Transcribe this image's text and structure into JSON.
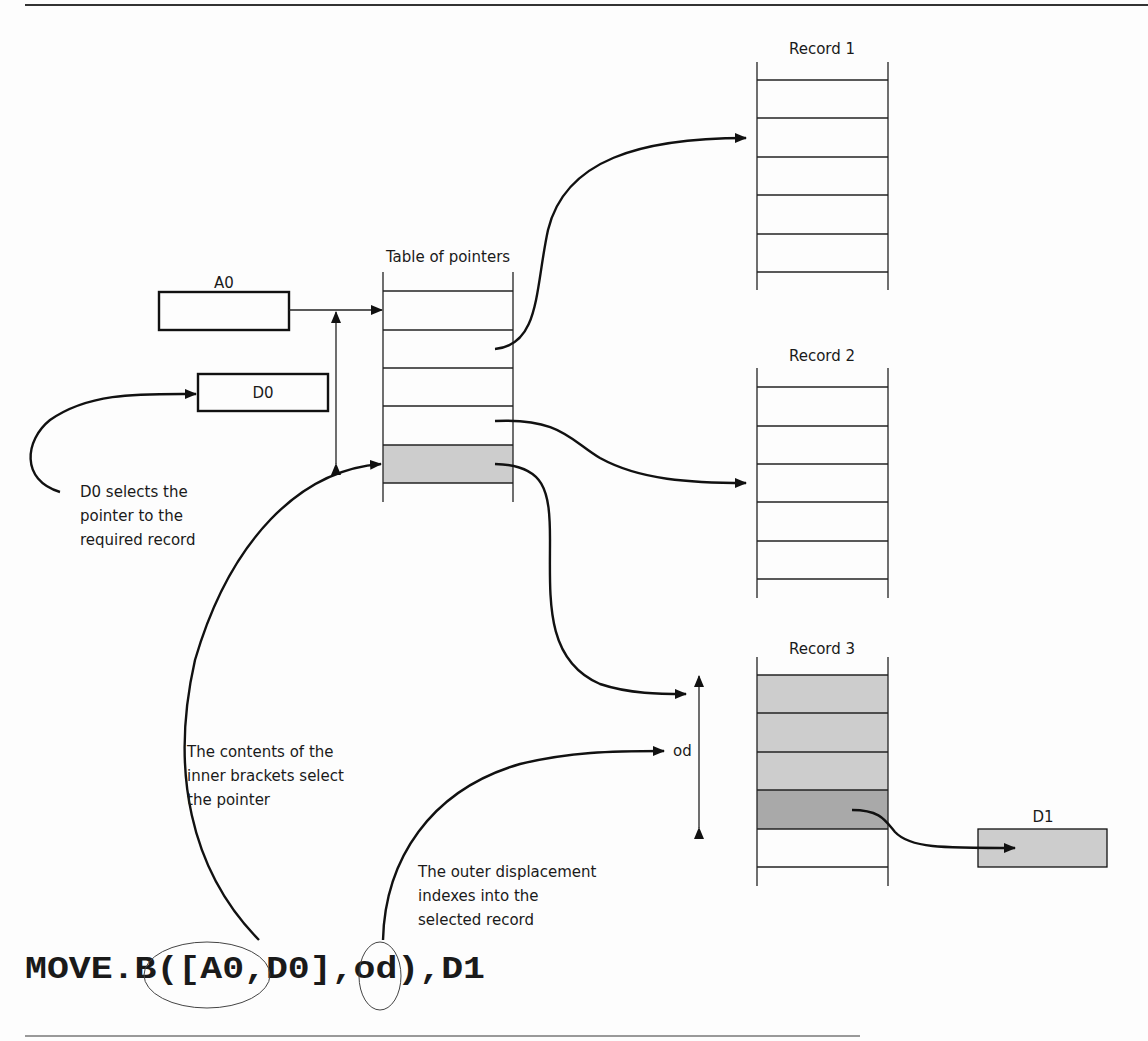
{
  "diagram": {
    "colors": {
      "line": "#111111",
      "shade_light": "#cdcdcd",
      "shade_dark": "#a9a9a9",
      "background": "#fdfdfd"
    },
    "registers": {
      "a0": {
        "label": "A0"
      },
      "d0": {
        "label": "D0"
      },
      "d1": {
        "label": "D1"
      }
    },
    "table_of_pointers": {
      "title": "Table of pointers",
      "rows": 5,
      "selected_row_index": 4
    },
    "records": [
      {
        "title": "Record 1",
        "rows": 6,
        "shaded_rows": [],
        "selected_row": null
      },
      {
        "title": "Record 2",
        "rows": 6,
        "shaded_rows": [],
        "selected_row": null
      },
      {
        "title": "Record 3",
        "rows": 6,
        "shaded_rows": [
          0,
          1,
          2
        ],
        "selected_row": 3
      }
    ],
    "od_label": "od",
    "annotations": {
      "d0_note": [
        "D0 selects the",
        "pointer to the",
        "required record"
      ],
      "inner_note": [
        "The contents of the",
        "inner brackets select",
        "the pointer"
      ],
      "outer_note": [
        "The outer displacement",
        "indexes into the",
        "selected record"
      ]
    },
    "instruction": {
      "full": "MOVE.B([A0,D0],od),D1",
      "prefix": "MOVE.B(",
      "inner": "[A0,D0]",
      "comma1": ",",
      "od": "od",
      "suffix": "),D1"
    }
  }
}
